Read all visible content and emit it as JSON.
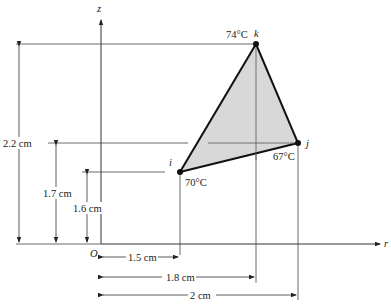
{
  "axes": {
    "vertical_label": "z",
    "horizontal_label": "r",
    "origin_label": "O"
  },
  "nodes": [
    {
      "id": "i",
      "label": "i",
      "temperature": "70°C",
      "r_cm": 1.5,
      "z_cm": 1.6
    },
    {
      "id": "j",
      "label": "j",
      "temperature": "67°C",
      "r_cm": 2.0,
      "z_cm": 1.7
    },
    {
      "id": "k",
      "label": "k",
      "temperature": "74°C",
      "r_cm": 1.8,
      "z_cm": 2.2
    }
  ],
  "dimensions": {
    "vertical": [
      "2.2 cm",
      "1.7 cm",
      "1.6 cm"
    ],
    "horizontal": [
      "1.5 cm",
      "1.8 cm",
      "2 cm"
    ]
  },
  "element_fill": "#d8d8d8",
  "line_color": "#222222"
}
